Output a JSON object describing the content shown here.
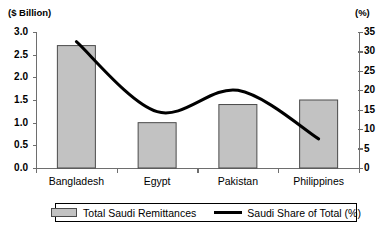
{
  "chart_data": {
    "type": "bar",
    "title": "",
    "categories": [
      "Bangladesh",
      "Egypt",
      "Pakistan",
      "Philippines"
    ],
    "series": [
      {
        "name": "Total Saudi Remittances",
        "type": "bar",
        "axis": "left",
        "values": [
          2.7,
          1.0,
          1.4,
          1.5
        ],
        "color": "#c2c2c2"
      },
      {
        "name": "Saudi Share of Total (%)",
        "type": "line",
        "axis": "right",
        "values": [
          32.5,
          14.5,
          20.0,
          7.5
        ],
        "color": "#000000"
      }
    ],
    "xlabel": "",
    "ylabel": "($  Billion)",
    "y2label": "(%)",
    "ylim": [
      0.0,
      3.0
    ],
    "y2lim": [
      0,
      35
    ],
    "yticks": [
      "0.0",
      "0.5",
      "1.0",
      "1.5",
      "2.0",
      "2.5",
      "3.0"
    ],
    "y2ticks": [
      "0",
      "5",
      "10",
      "15",
      "20",
      "25",
      "30",
      "35"
    ],
    "grid": false,
    "legend_position": "bottom-center"
  },
  "axes": {
    "left_title": "($  Billion)",
    "right_title": "(%)"
  },
  "legend": {
    "entries": [
      {
        "label": "Total Saudi Remittances",
        "marker": "bar-swatch"
      },
      {
        "label": "Saudi Share of Total (%)",
        "marker": "line-swatch"
      }
    ]
  }
}
